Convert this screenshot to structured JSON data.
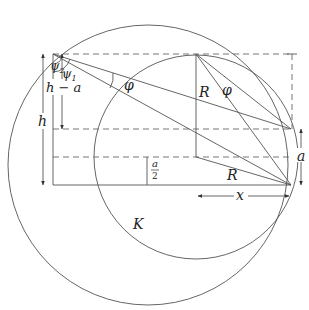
{
  "diagram": {
    "labels": {
      "psi2": "ψ",
      "psi2_sub": "2",
      "psi1": "ψ",
      "psi1_sub": "1",
      "h_minus_a": "h − a",
      "h": "h",
      "phi_left": "φ",
      "phi_right": "φ",
      "R_top": "R",
      "R_bottom": "R",
      "a": "a",
      "a_half_num": "a",
      "a_half_den": "2",
      "x": "x",
      "K": "K"
    },
    "geometry": {
      "big_circle": {
        "cx": 148,
        "cy": 165,
        "r": 140
      },
      "small_circle": {
        "cx": 196,
        "cy": 157,
        "r": 102
      },
      "apex": [
        53,
        54
      ],
      "point_upper": [
        291,
        129
      ],
      "point_lower": [
        291,
        185
      ],
      "small_circle_top": [
        196,
        54
      ]
    },
    "colors": {
      "line": "#555555",
      "text": "#222222",
      "background": "#ffffff"
    }
  }
}
